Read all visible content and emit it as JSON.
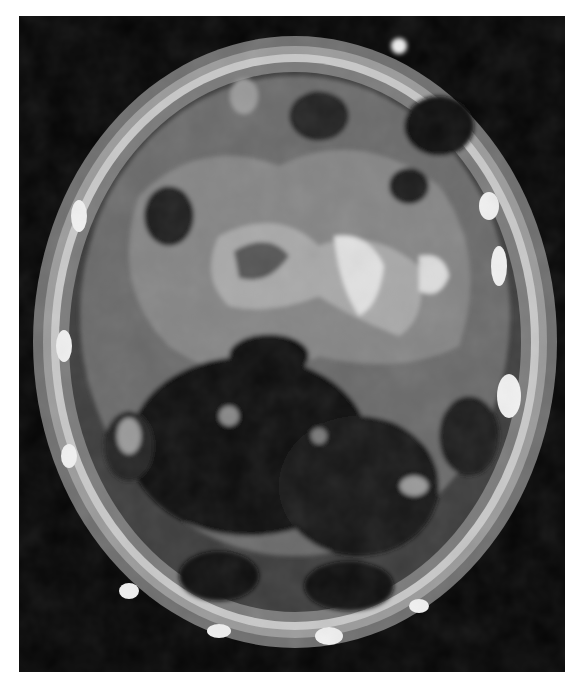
{
  "image": {
    "description": "Grayscale contour-rendered axial brain scan (SPECT/PET style) on black background",
    "colors": {
      "background": "#050505",
      "page": "#ffffff",
      "low": "#3a3a3a",
      "mid": "#6e6e6e",
      "high": "#9a9a9a",
      "peak": "#e8e8e8"
    }
  }
}
